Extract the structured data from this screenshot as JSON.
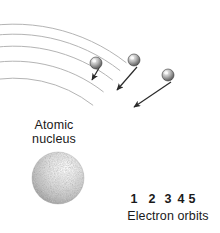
{
  "figure": {
    "kind": "bohr-atom-diagram",
    "background_color": "#ffffff",
    "ink_color": "#1a1a1a",
    "orbit_line_color": "#b4b4b4"
  },
  "nucleus": {
    "label_line1": "Atomic",
    "label_line2": "nucleus",
    "center_x": 58,
    "center_y": 178,
    "radius": 26,
    "fill_color": "#cccccc",
    "highlight_color": "#f2f2f2"
  },
  "orbits": {
    "caption": "Electron orbits",
    "center_x": 14,
    "center_y": 206,
    "radii": [
      128,
      145,
      160,
      172,
      182
    ],
    "numbers": [
      {
        "label": "1",
        "x": 134
      },
      {
        "label": "2",
        "x": 152
      },
      {
        "label": "3",
        "x": 168
      },
      {
        "label": "4",
        "x": 181
      },
      {
        "label": "5",
        "x": 192
      }
    ]
  },
  "electrons": [
    {
      "name": "electron-1",
      "cx": 96,
      "cy": 63,
      "r": 6
    },
    {
      "name": "electron-2",
      "cx": 134,
      "cy": 60,
      "r": 6
    },
    {
      "name": "electron-3",
      "cx": 168,
      "cy": 75,
      "r": 6
    }
  ],
  "transition_arrows": [
    {
      "name": "transition-arrow-1",
      "x1": 99,
      "y1": 68,
      "x2": 92,
      "y2": 80
    },
    {
      "name": "transition-arrow-2",
      "x1": 137,
      "y1": 67,
      "x2": 117,
      "y2": 90
    },
    {
      "name": "transition-arrow-3",
      "x1": 171,
      "y1": 82,
      "x2": 134,
      "y2": 107
    }
  ],
  "chart_data": {
    "type": "diagram",
    "labels": [
      "Atomic nucleus",
      "Electron orbits",
      "1",
      "2",
      "3",
      "4",
      "5"
    ],
    "orbit_count": 5,
    "electron_count": 3,
    "arrow_count": 3,
    "orbit_labels": [
      "1",
      "2",
      "3",
      "4",
      "5"
    ]
  }
}
